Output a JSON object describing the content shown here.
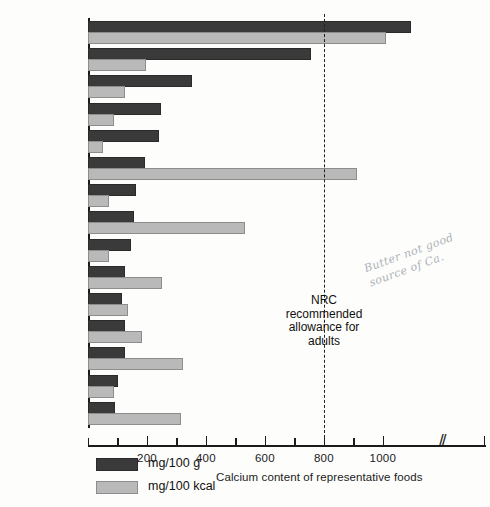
{
  "chart_data": {
    "type": "bar",
    "orientation": "horizontal",
    "title": "",
    "xlabel": "Calcium content of representative foods",
    "ylabel": "",
    "xlim": [
      0,
      1100
    ],
    "xticks": [
      0,
      100,
      200,
      300,
      400,
      500,
      600,
      700,
      800,
      900,
      1000
    ],
    "xtick_labels": [
      "",
      "",
      "200",
      "",
      "400",
      "",
      "600",
      "",
      "800",
      "",
      "1000"
    ],
    "grid": false,
    "axis_break_after": 1000,
    "legend_position": "bottom-left",
    "categories": [
      "Fish flour",
      "Cheddar cheese",
      "Sardines",
      "Waffles",
      "Almonds",
      "Turnip greens",
      "Salmon",
      "Collards",
      "Ice cream",
      "Yogurt",
      "Milk (chocolate)",
      "Milk (3.2% fat)",
      "",
      "Cottage cheese",
      "Broccoli"
    ],
    "category_lines": [
      [
        "Fish flour"
      ],
      [
        "Cheddar cheese"
      ],
      [
        "Sardines"
      ],
      [
        "Waffles"
      ],
      [
        "Almonds"
      ],
      [
        "Turnip greens"
      ],
      [
        "Salmon"
      ],
      [
        "Collards"
      ],
      [
        "Ice cream"
      ],
      [
        "Yogurt"
      ],
      [
        "Milk",
        "(chocolate)"
      ],
      [
        "Milk",
        "(3.2% fat)"
      ],
      [
        ""
      ],
      [
        "Cottage cheese"
      ],
      [
        "Broccoli"
      ]
    ],
    "series": [
      {
        "name": "mg/100 g",
        "color": "#3a3a3a",
        "values": [
          1090,
          750,
          345,
          240,
          235,
          185,
          155,
          150,
          140,
          120,
          110,
          120,
          120,
          95,
          85
        ]
      },
      {
        "name": "mg/100 kcal",
        "color": "#b9b9b9",
        "values": [
          1005,
          190,
          120,
          80,
          45,
          905,
          65,
          525,
          65,
          245,
          130,
          175,
          315,
          80,
          310
        ]
      }
    ],
    "annotations": [
      {
        "name": "nrc-reference-line",
        "value": 800,
        "style": "dashed",
        "label_lines": [
          "NRC",
          "recommended",
          "allowance for",
          "adults"
        ]
      }
    ],
    "handwritten_note": [
      "Butter not good",
      "source of Ca."
    ]
  },
  "legend": {
    "items": [
      {
        "label": "mg/100 g",
        "swatch": "dark"
      },
      {
        "label": "mg/100 kcal",
        "swatch": "light"
      }
    ]
  }
}
